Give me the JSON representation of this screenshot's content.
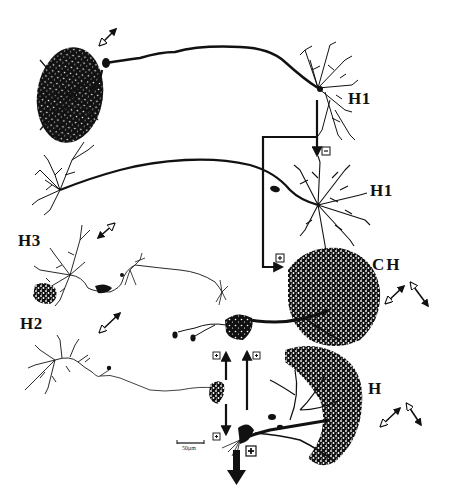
{
  "figure": {
    "type": "neuron-morphology-circuit-diagram",
    "background": "#ffffff",
    "ink": "#111111"
  },
  "cells": [
    {
      "id": "h1-top",
      "label": "H1",
      "label_pos": [
        348,
        90
      ]
    },
    {
      "id": "h1-middle",
      "label": "H1",
      "label_pos": [
        370,
        183
      ]
    },
    {
      "id": "h3",
      "label": "H3",
      "label_pos": [
        18,
        233
      ]
    },
    {
      "id": "ch",
      "label": "CH",
      "label_pos": [
        372,
        257
      ]
    },
    {
      "id": "h2",
      "label": "H2",
      "label_pos": [
        20,
        316
      ]
    },
    {
      "id": "h",
      "label": "H",
      "label_pos": [
        368,
        381
      ]
    }
  ],
  "connections": [
    {
      "from": "h1-top",
      "to": "h1-middle",
      "sign": "−",
      "sign_label": "minus"
    },
    {
      "from": "h1-top",
      "to": "ch",
      "sign": "+",
      "sign_label": "plus"
    },
    {
      "from": "h2",
      "to": "ch",
      "sign": "+",
      "sign_label": "plus"
    },
    {
      "from": "h",
      "to": "ch",
      "sign": "+",
      "sign_label": "plus"
    },
    {
      "from": "h2",
      "to": "h",
      "sign": "+",
      "sign_label": "plus"
    },
    {
      "from": "h",
      "to": "output",
      "sign": "+",
      "sign_label": "plus"
    }
  ],
  "direction_arrows": [
    {
      "near": "h1-top",
      "type": "single-bidirectional"
    },
    {
      "near": "h3",
      "type": "single-bidirectional"
    },
    {
      "near": "h2",
      "type": "single-bidirectional"
    },
    {
      "near": "ch",
      "type": "double-v"
    },
    {
      "near": "h",
      "type": "double-v"
    }
  ],
  "scale_bar": {
    "label": "50μm"
  }
}
